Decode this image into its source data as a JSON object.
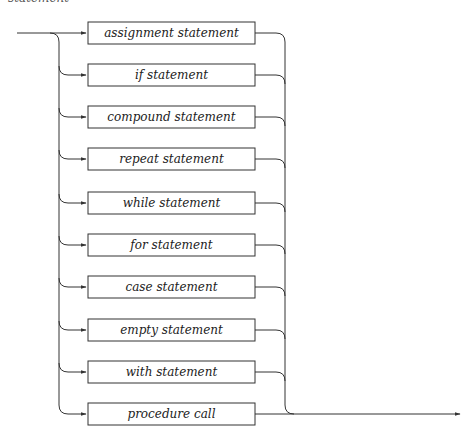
{
  "diagram": {
    "title_fragment": "statement",
    "kind": "syntax diagram",
    "alternatives": [
      {
        "label": "assignment statement"
      },
      {
        "label": "if statement"
      },
      {
        "label": "compound statement"
      },
      {
        "label": "repeat statement"
      },
      {
        "label": "while statement"
      },
      {
        "label": "for statement"
      },
      {
        "label": "case statement"
      },
      {
        "label": "empty statement"
      },
      {
        "label": "with statement"
      },
      {
        "label": "procedure call"
      }
    ],
    "colors": {
      "line": "#333333",
      "box_border": "#333333",
      "text": "#222222",
      "background": "#ffffff"
    }
  }
}
